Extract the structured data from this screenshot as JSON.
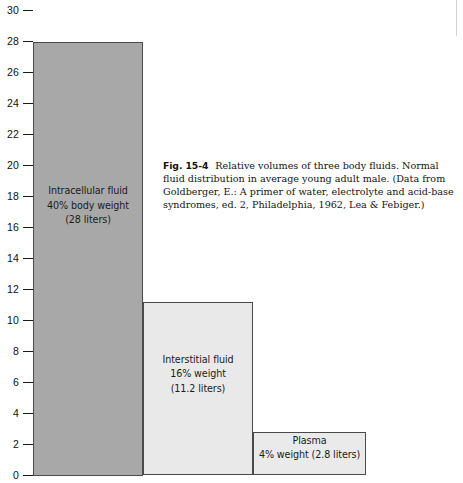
{
  "chart_data": {
    "type": "bar",
    "title": "",
    "xlabel": "",
    "ylabel": "",
    "ylim": [
      0,
      30
    ],
    "ytick_step": 2,
    "yticks": [
      0,
      2,
      4,
      6,
      8,
      10,
      12,
      14,
      16,
      18,
      20,
      22,
      24,
      26,
      28,
      30
    ],
    "grid": false,
    "legend": "none",
    "units": "liters",
    "categories": [
      "Intracellular fluid",
      "Interstitial fluid",
      "Plasma"
    ],
    "values": [
      28,
      11.2,
      2.8
    ],
    "bars": [
      {
        "name": "Intracellular fluid",
        "value": 28,
        "fill": "#a8a8a8",
        "border": "#4a4a4a",
        "label_lines": [
          "Intracellular fluid",
          "40% body weight",
          "(28 liters)"
        ]
      },
      {
        "name": "Interstitial fluid",
        "value": 11.2,
        "fill": "#e9e9e9",
        "border": "#4a4a4a",
        "label_lines": [
          "Interstitial fluid",
          "16% weight",
          "(11.2 liters)"
        ]
      },
      {
        "name": "Plasma",
        "value": 2.8,
        "fill": "#eaeaea",
        "border": "#4a4a4a",
        "label_lines": [
          "Plasma",
          "4% weight (2.8 liters)"
        ]
      }
    ]
  },
  "caption": {
    "figure_number": "Fig. 15-4",
    "text": "Relative volumes of three body fluids. Normal fluid distribution in average young adult male. (Data from Goldberger, E.: A primer of water, electrolyte and acid-base syndromes, ed. 2, Philadelphia, 1962, Lea & Febiger.)"
  }
}
